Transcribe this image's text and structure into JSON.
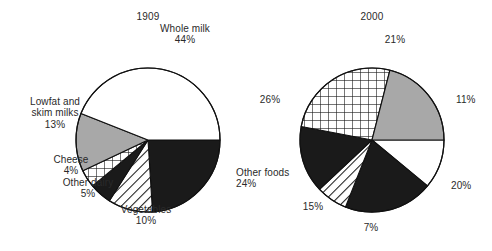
{
  "figure": {
    "background": "#ffffff",
    "width": 492,
    "height": 251,
    "stroke": "#111111"
  },
  "charts": [
    {
      "id": "pie-1909",
      "title": "1909",
      "center": [
        148,
        140
      ],
      "radius": 72,
      "title_pos": [
        148,
        17
      ]
    },
    {
      "id": "pie-2000",
      "title": "2000",
      "center": [
        372,
        140
      ],
      "radius": 72,
      "title_pos": [
        372,
        17
      ]
    }
  ],
  "labels_1909": [
    {
      "name": "whole-milk",
      "text": "Whole milk\n44%",
      "x": 185,
      "y": 34,
      "align": "c"
    },
    {
      "name": "other-foods",
      "text": "Other foods\n24%",
      "x": 236,
      "y": 178,
      "align": "l"
    },
    {
      "name": "vegetables",
      "text": "Vegetables\n10%",
      "x": 146,
      "y": 215,
      "align": "c"
    },
    {
      "name": "other-dairy",
      "text": "Other dairy\n5%",
      "x": 88,
      "y": 188,
      "align": "c"
    },
    {
      "name": "cheese",
      "text": "Cheese\n4%",
      "x": 71,
      "y": 165,
      "align": "c"
    },
    {
      "name": "lowfat",
      "text": "Lowfat and\nskim milks\n13%",
      "x": 55,
      "y": 113,
      "align": "c"
    }
  ],
  "labels_2000": [
    {
      "name": "pct-21",
      "text": "21%",
      "x": 395,
      "y": 40,
      "align": "c"
    },
    {
      "name": "pct-11",
      "text": "11%",
      "x": 456,
      "y": 100,
      "align": "l"
    },
    {
      "name": "pct-20",
      "text": "20%",
      "x": 451,
      "y": 186,
      "align": "l"
    },
    {
      "name": "pct-7",
      "text": "7%",
      "x": 371,
      "y": 228,
      "align": "c"
    },
    {
      "name": "pct-15",
      "text": "15%",
      "x": 313,
      "y": 207,
      "align": "c"
    },
    {
      "name": "pct-26",
      "text": "26%",
      "x": 270,
      "y": 100,
      "align": "c"
    }
  ],
  "chart_data": [
    {
      "type": "pie",
      "title": "1909",
      "xlabel": "",
      "ylabel": "",
      "legend": "labels placed around slices",
      "grid": false,
      "start_angle_deg": 0,
      "direction": "clockwise",
      "categories": [
        "Other foods",
        "Vegetables",
        "Other dairy",
        "Cheese",
        "Lowfat and skim milks",
        "Whole milk"
      ],
      "values": [
        24,
        10,
        5,
        4,
        13,
        44
      ],
      "unit": "%",
      "data_labels": [
        "Other foods 24%",
        "Vegetables 10%",
        "Other dairy 5%",
        "Cheese 4%",
        "Lowfat and skim milks 13%",
        "Whole milk 44%"
      ],
      "fills": [
        "solid-black",
        "diagonal-hatch",
        "solid-black",
        "crosshatch",
        "gray",
        "white"
      ]
    },
    {
      "type": "pie",
      "title": "2000",
      "xlabel": "",
      "ylabel": "",
      "legend": "percent-only labels placed around slices",
      "grid": false,
      "start_angle_deg": 0,
      "direction": "clockwise",
      "categories": [
        "11%",
        "20%",
        "7%",
        "15%",
        "26%",
        "21%"
      ],
      "values": [
        11,
        20,
        7,
        15,
        26,
        21
      ],
      "unit": "%",
      "data_labels": [
        "11%",
        "20%",
        "7%",
        "15%",
        "26%",
        "21%"
      ],
      "fills": [
        "white",
        "solid-black",
        "diagonal-hatch",
        "solid-black",
        "crosshatch",
        "gray"
      ]
    }
  ],
  "palette": {
    "black": "#1a1a1a",
    "gray": "#a8a8a8",
    "white": "#ffffff",
    "outline": "#111111"
  }
}
